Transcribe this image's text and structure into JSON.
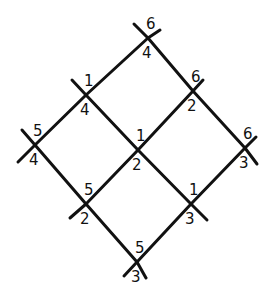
{
  "diagram": {
    "type": "rotated-grid-lattice",
    "stroke_color": "#111111",
    "background": "#ffffff",
    "nodes": [
      {
        "id": "n00",
        "x": 148,
        "y": 38,
        "above": "6",
        "below": "4"
      },
      {
        "id": "n10",
        "x": 86,
        "y": 95,
        "above": "1",
        "below": "4"
      },
      {
        "id": "n01",
        "x": 193,
        "y": 91,
        "above": "6",
        "below": "2"
      },
      {
        "id": "n20",
        "x": 35,
        "y": 145,
        "above": "5",
        "below": "4"
      },
      {
        "id": "n11",
        "x": 138,
        "y": 150,
        "above": "1",
        "below": "2"
      },
      {
        "id": "n02",
        "x": 245,
        "y": 148,
        "above": "6",
        "below": "3"
      },
      {
        "id": "n21",
        "x": 86,
        "y": 204,
        "above": "5",
        "below": "2"
      },
      {
        "id": "n12",
        "x": 191,
        "y": 204,
        "above": "1",
        "below": "3"
      },
      {
        "id": "n22",
        "x": 137,
        "y": 262,
        "above": "5",
        "below": "3"
      }
    ],
    "edges": [
      [
        "n20",
        "n10"
      ],
      [
        "n10",
        "n00"
      ],
      [
        "n21",
        "n11"
      ],
      [
        "n11",
        "n01"
      ],
      [
        "n22",
        "n12"
      ],
      [
        "n12",
        "n02"
      ],
      [
        "n00",
        "n01"
      ],
      [
        "n01",
        "n02"
      ],
      [
        "n10",
        "n11"
      ],
      [
        "n11",
        "n12"
      ],
      [
        "n20",
        "n21"
      ],
      [
        "n21",
        "n22"
      ]
    ],
    "labels": {
      "n00": {
        "above": "6",
        "below": "4"
      },
      "n10": {
        "above": "1",
        "below": "4"
      },
      "n01": {
        "above": "6",
        "below": "2"
      },
      "n20": {
        "above": "5",
        "below": "4"
      },
      "n11": {
        "above": "1",
        "below": "2"
      },
      "n02": {
        "above": "6",
        "below": "3"
      },
      "n21": {
        "above": "5",
        "below": "2"
      },
      "n12": {
        "above": "1",
        "below": "3"
      },
      "n22": {
        "above": "5",
        "below": "3"
      }
    }
  }
}
